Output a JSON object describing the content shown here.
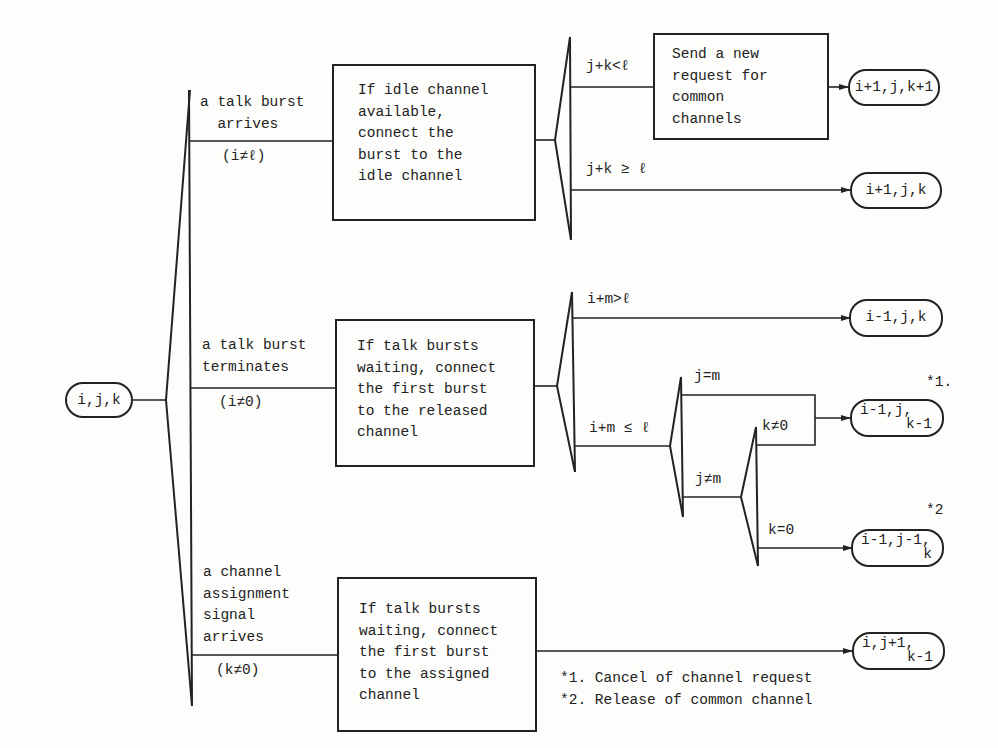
{
  "diagram": {
    "start_state": "i,j,k",
    "events": [
      {
        "label": "a talk burst\n  arrives",
        "condition": "(i≠ℓ)",
        "action": "If idle channel\navailable,\nconnect the\nburst to the\nidle channel"
      },
      {
        "label": "a talk burst\nterminates",
        "condition": "(i≠0)",
        "action": "If talk bursts\nwaiting, connect\nthe first burst\nto the released\nchannel"
      },
      {
        "label": "a channel\nassignment\nsignal\narrives",
        "condition": "(k≠0)",
        "action": "If talk bursts\nwaiting, connect\nthe first burst\nto the assigned\nchannel"
      }
    ],
    "arrival_branches": {
      "cond_lt": "j+k<ℓ",
      "cond_ge": "j+k ≥ ℓ",
      "request_box": "Send a new\nrequest for\ncommon\nchannels",
      "state_lt_l1": "i+1,j,k+1",
      "state_ge": "i+1,j,k"
    },
    "termination_branches": {
      "cond_gt": "i+m>ℓ",
      "cond_le": "i+m ≤ ℓ",
      "state_gt": "i-1,j,k",
      "cond_j_eq_m": "j=m",
      "cond_j_ne_m": "j≠m",
      "cond_k_ne_0": "k≠0",
      "cond_k_eq_0": "k=0",
      "state_cancel_l1": "i-1,j,",
      "state_cancel_l2": "k-1",
      "state_release_l1": "i-1,j-1,",
      "state_release_l2": "k",
      "mark_cancel": "*1.",
      "mark_release": "*2"
    },
    "assignment_branch": {
      "state_l1": "i,j+1,",
      "state_l2": "k-1"
    },
    "footnotes": [
      "*1. Cancel of channel request",
      "*2. Release of common channel"
    ]
  }
}
